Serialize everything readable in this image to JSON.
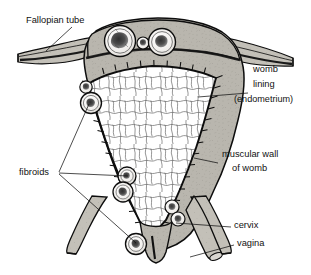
{
  "figure": {
    "type": "anatomical-line-diagram",
    "background_color": "#ffffff",
    "ink_color": "#0d0d0d",
    "muscle_fill": "#b9b6ae",
    "tube_fill": "#c3c0b8",
    "cavity_fill": "#ffffff",
    "fibroid_fill": "#f2f0ec",
    "fibroid_core": "#2b2b2b"
  },
  "labels": {
    "fallopian_tube": "Fallopian tube",
    "womb_lining_line1": "womb",
    "womb_lining_line2": "lining",
    "womb_lining_line3": "(endometrium)",
    "muscular_wall_line1": "muscular wall",
    "muscular_wall_line2": "of womb",
    "fibroids": "fibroids",
    "cervix": "cervix",
    "vagina": "vagina"
  },
  "structures": [
    {
      "name": "fallopian-tube-left",
      "side": "left"
    },
    {
      "name": "fallopian-tube-right",
      "side": "right"
    },
    {
      "name": "uterine-fundus",
      "side": "center"
    },
    {
      "name": "endometrial-cavity",
      "side": "center"
    },
    {
      "name": "myometrium-left",
      "side": "left"
    },
    {
      "name": "myometrium-right",
      "side": "right"
    },
    {
      "name": "round-ligament-left",
      "side": "left"
    },
    {
      "name": "round-ligament-right",
      "side": "right"
    },
    {
      "name": "cervix",
      "side": "center"
    },
    {
      "name": "vagina",
      "side": "center"
    }
  ],
  "fibroids": [
    {
      "id": 1,
      "location": "fundus-left",
      "cx": 120,
      "cy": 41,
      "r": 15.5,
      "type": "intramural"
    },
    {
      "id": 2,
      "location": "fundus-center",
      "cx": 143,
      "cy": 43,
      "r": 6.0,
      "type": "intramural"
    },
    {
      "id": 3,
      "location": "fundus-right",
      "cx": 162,
      "cy": 42,
      "r": 13.5,
      "type": "intramural"
    },
    {
      "id": 4,
      "location": "wall-left-upper",
      "cx": 86,
      "cy": 87,
      "r": 6.2,
      "type": "intramural"
    },
    {
      "id": 5,
      "location": "wall-left-mid",
      "cx": 91,
      "cy": 103,
      "r": 10.5,
      "type": "intramural"
    },
    {
      "id": 6,
      "location": "wall-left-lower",
      "cx": 127,
      "cy": 176,
      "r": 9.0,
      "type": "intramural"
    },
    {
      "id": 7,
      "location": "wall-left-lowest",
      "cx": 123,
      "cy": 192,
      "r": 10.0,
      "type": "intramural"
    },
    {
      "id": 8,
      "location": "cervix-right-upper",
      "cx": 172,
      "cy": 207,
      "r": 7.0,
      "type": "intramural"
    },
    {
      "id": 9,
      "location": "cervix-right-lower",
      "cx": 178,
      "cy": 219,
      "r": 7.0,
      "type": "intramural"
    },
    {
      "id": 10,
      "location": "ligament-left",
      "cx": 136,
      "cy": 244,
      "r": 10.5,
      "type": "intramural"
    }
  ],
  "label_positions": {
    "fallopian_tube": {
      "x": 26,
      "y": 21
    },
    "womb_lining": {
      "x": 253,
      "y": 87
    },
    "muscular_wall": {
      "x": 222,
      "y": 161
    },
    "fibroids": {
      "x": 19,
      "y": 172
    },
    "cervix": {
      "x": 234,
      "y": 225
    },
    "vagina": {
      "x": 237,
      "y": 243
    }
  }
}
